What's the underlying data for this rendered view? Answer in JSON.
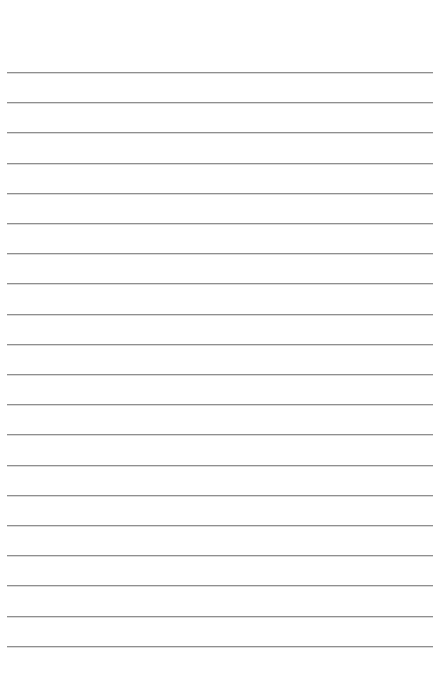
{
  "page": {
    "type": "lined-paper",
    "background": "#ffffff",
    "line_color": "#8f8f8f",
    "line_count": 20,
    "first_line_y": 72,
    "line_spacing": 30.2,
    "line_left": 7,
    "line_right": 433,
    "text_lines": [
      "",
      "",
      "",
      "",
      "",
      "",
      "",
      "",
      "",
      "",
      "",
      "",
      "",
      "",
      "",
      "",
      "",
      "",
      "",
      ""
    ]
  }
}
